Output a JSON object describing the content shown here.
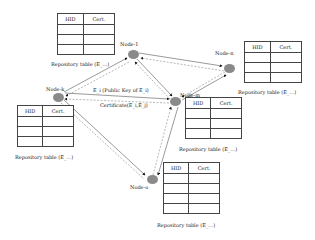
{
  "diagram": {
    "nodes": [
      {
        "id": "node-1",
        "label": "Node-1"
      },
      {
        "id": "node-n",
        "label": "Node-n"
      },
      {
        "id": "node-k",
        "label": "Node-k"
      },
      {
        "id": "node-m",
        "label": "Node-m"
      },
      {
        "id": "node-o",
        "label": "Node-o"
      }
    ],
    "tables": [
      {
        "id": "table-1",
        "headers": [
          "HID",
          "Cert."
        ],
        "caption": "Repository table (E_...)"
      },
      {
        "id": "table-n",
        "headers": [
          "HID",
          "Cert."
        ],
        "caption": "Repository table (E_...)"
      },
      {
        "id": "table-k",
        "headers": [
          "HID",
          "Cert."
        ],
        "caption": "Repository table (E_...)"
      },
      {
        "id": "table-m",
        "headers": [
          "HID",
          "Cert."
        ],
        "caption": "Repository table (E_...)"
      },
      {
        "id": "table-o",
        "headers": [
          "HID",
          "Cert."
        ],
        "caption": "Repository table (E_...)"
      }
    ],
    "edge_labels": {
      "public_key": "E_i (Public Key of E_i)",
      "certificate": "Certificate(E_i,E_j)"
    }
  }
}
